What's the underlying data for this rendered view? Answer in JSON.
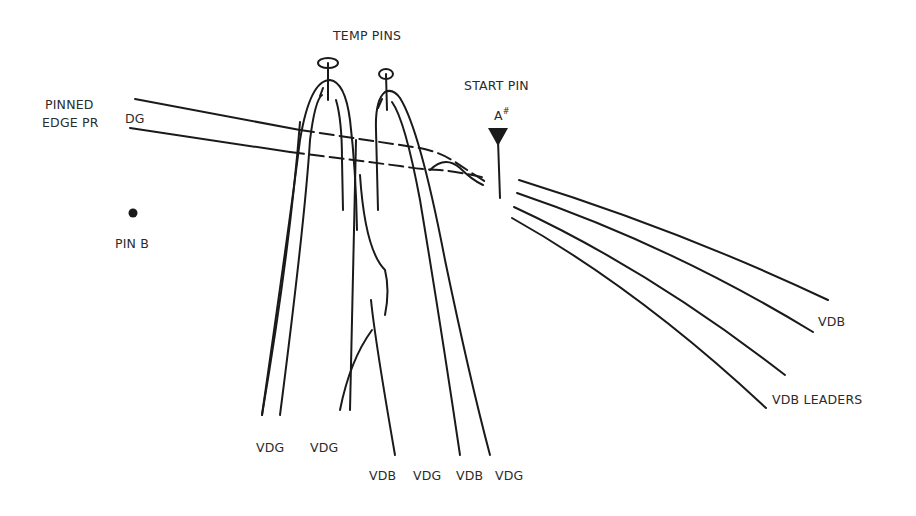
{
  "diagram": {
    "labels": {
      "temp_pins": "TEMP PINS",
      "start_pin": "START PIN",
      "start_pin_id": "A",
      "start_pin_sup": "#",
      "pinned_edge_line1": "PINNED",
      "pinned_edge_line2": "EDGE PR",
      "edge_color": "DG",
      "pin_b": "PIN B",
      "vdb_right": "VDB",
      "vdb_leaders": "VDB LEADERS",
      "bottom_left": [
        "VDG",
        "VDG"
      ],
      "bottom_right": [
        "VDB",
        "VDG",
        "VDB",
        "VDG"
      ]
    },
    "elements": {
      "temp_pin_count": 2,
      "start_pin_marker": "filled-triangle",
      "pin_b_marker": "filled-dot",
      "right_leader_count": 4
    },
    "colors": {
      "line": "#1a1a1a",
      "text": "#2b2b2b",
      "background": "#ffffff"
    }
  }
}
